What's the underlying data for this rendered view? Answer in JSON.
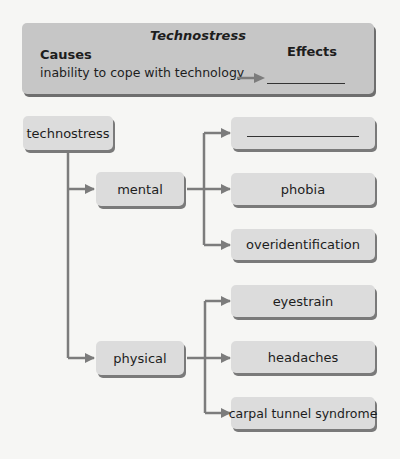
{
  "header": {
    "title": "Technostress",
    "causes_label": "Causes",
    "effects_label": "Effects",
    "cause_text": "inability to cope with technology",
    "effect_value": ""
  },
  "diagram": {
    "root": "technostress",
    "branches": [
      {
        "label": "mental",
        "children": [
          "",
          "phobia",
          "overidentification"
        ]
      },
      {
        "label": "physical",
        "children": [
          "eyestrain",
          "headaches",
          "carpal tunnel syndrome"
        ]
      }
    ]
  },
  "colors": {
    "header_bg": "#c6c6c6",
    "node_bg": "#dcdcdc",
    "connector": "#7c7c7c",
    "background": "#f6f6f4"
  }
}
